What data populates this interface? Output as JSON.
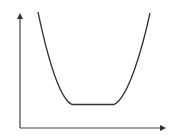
{
  "diagram": {
    "type": "u-shaped-curve-on-axes",
    "colors": {
      "background": "#ffffff",
      "axis": "#444444",
      "curve": "#333333"
    },
    "axes": {
      "origin": [
        20,
        128
      ],
      "y_axis_top": [
        20,
        13
      ],
      "x_axis_right": [
        166,
        128
      ],
      "x_label": "",
      "y_label": ""
    },
    "curve": {
      "description": "Bathtub curve: steep descent, flat minimum, steep ascent",
      "path": "M38,12 C46,50 58,98 72,104.5 L114,104.5 C128,98 142,50 150,13"
    }
  }
}
